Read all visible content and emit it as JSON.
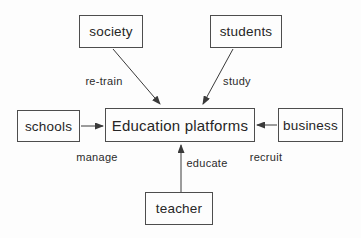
{
  "diagram": {
    "type": "flow-diagram",
    "nodes": {
      "society": {
        "label": "society"
      },
      "students": {
        "label": "students"
      },
      "schools": {
        "label": "schools"
      },
      "center": {
        "label": "Education platforms"
      },
      "business": {
        "label": "business"
      },
      "teacher": {
        "label": "teacher"
      }
    },
    "edges": {
      "retrain": {
        "from": "society",
        "to": "center",
        "label": "re-train"
      },
      "study": {
        "from": "students",
        "to": "center",
        "label": "study"
      },
      "manage": {
        "from": "schools",
        "to": "center",
        "label": "manage"
      },
      "recruit": {
        "from": "business",
        "to": "center",
        "label": "recruit"
      },
      "educate": {
        "from": "teacher",
        "to": "center",
        "label": "educate"
      }
    },
    "colors": {
      "line": "#3a3a3a",
      "border": "#4d4d4d",
      "text": "#262626",
      "background": "#fdfdfd"
    }
  }
}
